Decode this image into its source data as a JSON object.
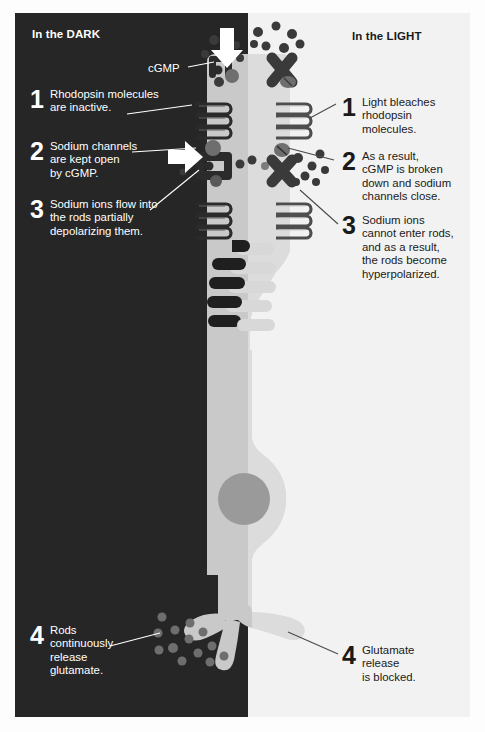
{
  "figure": {
    "type": "scientific-diagram",
    "panels": {
      "dark": {
        "title": "In the DARK"
      },
      "light": {
        "title": "In the LIGHT"
      }
    },
    "labels": {
      "cgmp": "cGMP"
    }
  },
  "dark_steps": [
    {
      "number": "1",
      "text": "Rhodopsin molecules\nare inactive."
    },
    {
      "number": "2",
      "text": "Sodium channels\nare kept open\nby cGMP."
    },
    {
      "number": "3",
      "text": "Sodium ions flow into\nthe rods partially\ndepolarizing them."
    },
    {
      "number": "4",
      "text": "Rods\ncontinuously\nrelease\nglutamate."
    }
  ],
  "light_steps": [
    {
      "number": "1",
      "text": "Light bleaches\nrhodopsin\nmolecules."
    },
    {
      "number": "2",
      "text": "As a result,\ncGMP is broken\ndown and sodium\nchannels close."
    },
    {
      "number": "3",
      "text": "Sodium ions\ncannot enter rods,\nand as a result,\nthe rods become\nhyperpolarized."
    },
    {
      "number": "4",
      "text": "Glutamate\nrelease\nis blocked."
    }
  ],
  "icons": {
    "arrow_cgmp_influx": "down-arrow-icon",
    "arrow_sodium_influx": "right-arrow-icon",
    "rhodopsin_active": "coiled-protein-icon",
    "rhodopsin_bleached": "coiled-protein-icon",
    "sodium_channel_open": "open-channel-icon",
    "sodium_channel_closed": "closed-channel-icon",
    "cgmp_molecule": "dot-molecule-icon",
    "sodium_ion": "dot-ion-icon",
    "glutamate_vesicle": "dot-vesicle-icon",
    "nucleus": "nucleus-icon"
  },
  "colors": {
    "dark_background": "#262626",
    "light_background": "#f2f2f2",
    "cell_body": "#c9c9c9",
    "cell_body_light": "#dedede",
    "nucleus": "#9a9a9a",
    "protein_dark": "#2b2b2b",
    "protein_mid": "#6e6e6e",
    "white": "#ffffff",
    "text_dark": "#1a1a1a"
  }
}
